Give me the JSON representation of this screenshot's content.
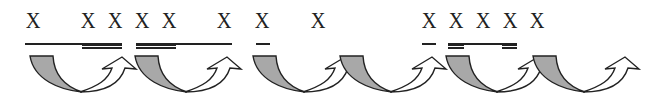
{
  "diagram": {
    "marks": [
      {
        "label": "X",
        "x": 33
      },
      {
        "label": "X",
        "x": 88
      },
      {
        "label": "X",
        "x": 115
      },
      {
        "label": "X",
        "x": 142
      },
      {
        "label": "X",
        "x": 169
      },
      {
        "label": "X",
        "x": 224
      },
      {
        "label": "X",
        "x": 262
      },
      {
        "label": "X",
        "x": 318
      },
      {
        "label": "X",
        "x": 429
      },
      {
        "label": "X",
        "x": 456
      },
      {
        "label": "X",
        "x": 483
      },
      {
        "label": "X",
        "x": 510
      },
      {
        "label": "X",
        "x": 537
      }
    ],
    "underlines": [
      {
        "type": "single",
        "x1": 25,
        "x2": 122
      },
      {
        "type": "double",
        "x1": 82,
        "x2": 122
      },
      {
        "type": "double",
        "x1": 136,
        "x2": 176
      },
      {
        "type": "single",
        "x1": 136,
        "x2": 232
      },
      {
        "type": "single",
        "x1": 256,
        "x2": 270
      },
      {
        "type": "single",
        "x1": 422,
        "x2": 436
      },
      {
        "type": "double",
        "x1": 448,
        "x2": 464
      },
      {
        "type": "single",
        "x1": 448,
        "x2": 517
      },
      {
        "type": "double",
        "x1": 502,
        "x2": 517
      }
    ],
    "arrows": [
      {
        "start_x": 30
      },
      {
        "start_x": 135
      },
      {
        "start_x": 253
      },
      {
        "start_x": 340
      },
      {
        "start_x": 446
      },
      {
        "start_x": 533
      }
    ],
    "colors": {
      "ink": "#222222",
      "band_fill": "#a8a8a8",
      "arrow_fill": "#ffffff",
      "background": "#ffffff"
    }
  }
}
